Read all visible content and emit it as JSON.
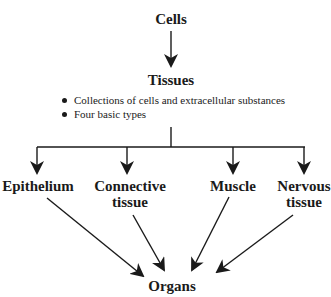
{
  "diagram": {
    "root": "Cells",
    "level2": "Tissues",
    "tissue_notes": [
      "Collections of cells and extracellular substances",
      "Four basic types"
    ],
    "tissue_types": [
      {
        "line1": "Epithelium",
        "line2": ""
      },
      {
        "line1": "Connective",
        "line2": "tissue"
      },
      {
        "line1": "Muscle",
        "line2": ""
      },
      {
        "line1": "Nervous",
        "line2": "tissue"
      }
    ],
    "result": "Organs"
  }
}
